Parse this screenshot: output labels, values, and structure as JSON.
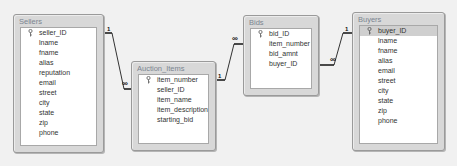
{
  "tables": [
    {
      "name": "Sellers",
      "fields": [
        {
          "name": "seller_ID",
          "key": true
        },
        {
          "name": "lname"
        },
        {
          "name": "fname"
        },
        {
          "name": "alias"
        },
        {
          "name": "reputation"
        },
        {
          "name": "email"
        },
        {
          "name": "street"
        },
        {
          "name": "city"
        },
        {
          "name": "state"
        },
        {
          "name": "zip"
        },
        {
          "name": "phone"
        }
      ]
    },
    {
      "name": "Auction_Items",
      "fields": [
        {
          "name": "item_number",
          "key": true
        },
        {
          "name": "seller_ID"
        },
        {
          "name": "item_name"
        },
        {
          "name": "item_description"
        },
        {
          "name": "starting_bid"
        }
      ]
    },
    {
      "name": "Bids",
      "fields": [
        {
          "name": "bid_ID",
          "key": true
        },
        {
          "name": "item_number"
        },
        {
          "name": "bid_amnt"
        },
        {
          "name": "buyer_ID"
        }
      ]
    },
    {
      "name": "Buyers",
      "fields": [
        {
          "name": "buyer_ID",
          "key": true,
          "selected": true
        },
        {
          "name": "lname"
        },
        {
          "name": "fname"
        },
        {
          "name": "alias"
        },
        {
          "name": "email"
        },
        {
          "name": "street"
        },
        {
          "name": "city"
        },
        {
          "name": "state"
        },
        {
          "name": "zip"
        },
        {
          "name": "phone"
        }
      ]
    }
  ],
  "relationships": [
    {
      "from": "Sellers.seller_ID",
      "to": "Auction_Items.seller_ID",
      "one_label": "1",
      "many_label": "∞"
    },
    {
      "from": "Auction_Items.item_number",
      "to": "Bids.item_number",
      "one_label": "1",
      "many_label": "∞"
    },
    {
      "from": "Buyers.buyer_ID",
      "to": "Bids.buyer_ID",
      "one_label": "1",
      "many_label": "∞"
    }
  ],
  "colors": {
    "background": "#f1f1f1",
    "table_frame": "#d8d8d8",
    "title_text": "#7a8590",
    "selected_row": "#cfcfcf",
    "line": "#111111"
  }
}
